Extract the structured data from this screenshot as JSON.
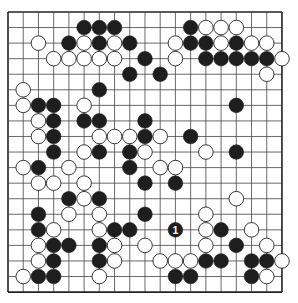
{
  "board": {
    "size": 19,
    "origin_x": 8,
    "origin_y": 12,
    "spacing_x": 15.22,
    "spacing_y": 15.56,
    "stone_radius": 7.3,
    "line_color": "#444444",
    "border_color": "#222222",
    "background": "#ffffff",
    "black_color": "#1e1e1e",
    "white_color": "#ffffff",
    "white_stroke": "#222222"
  },
  "stones": {
    "black": [
      [
        5,
        1
      ],
      [
        6,
        1
      ],
      [
        7,
        1
      ],
      [
        12,
        1
      ],
      [
        4,
        2
      ],
      [
        6,
        2
      ],
      [
        8,
        2
      ],
      [
        12,
        2
      ],
      [
        13,
        2
      ],
      [
        15,
        2
      ],
      [
        9,
        3
      ],
      [
        13,
        3
      ],
      [
        14,
        3
      ],
      [
        15,
        3
      ],
      [
        16,
        3
      ],
      [
        17,
        3
      ],
      [
        8,
        4
      ],
      [
        10,
        4
      ],
      [
        6,
        5
      ],
      [
        2,
        6
      ],
      [
        3,
        6
      ],
      [
        15,
        6
      ],
      [
        3,
        7
      ],
      [
        5,
        7
      ],
      [
        6,
        7
      ],
      [
        9,
        7
      ],
      [
        3,
        8
      ],
      [
        9,
        8
      ],
      [
        12,
        8
      ],
      [
        3,
        9
      ],
      [
        6,
        9
      ],
      [
        8,
        9
      ],
      [
        15,
        9
      ],
      [
        2,
        10
      ],
      [
        8,
        10
      ],
      [
        9,
        11
      ],
      [
        11,
        11
      ],
      [
        4,
        12
      ],
      [
        6,
        12
      ],
      [
        2,
        13
      ],
      [
        9,
        13
      ],
      [
        2,
        14
      ],
      [
        7,
        14
      ],
      [
        8,
        14
      ],
      [
        14,
        14
      ],
      [
        3,
        15
      ],
      [
        4,
        15
      ],
      [
        6,
        15
      ],
      [
        15,
        15
      ],
      [
        3,
        16
      ],
      [
        6,
        16
      ],
      [
        13,
        16
      ],
      [
        14,
        16
      ],
      [
        16,
        16
      ],
      [
        17,
        16
      ],
      [
        2,
        17
      ],
      [
        3,
        17
      ],
      [
        11,
        17
      ],
      [
        12,
        17
      ],
      [
        16,
        17
      ]
    ],
    "white": [
      [
        13,
        1
      ],
      [
        14,
        1
      ],
      [
        15,
        1
      ],
      [
        2,
        2
      ],
      [
        5,
        2
      ],
      [
        7,
        2
      ],
      [
        11,
        2
      ],
      [
        14,
        2
      ],
      [
        16,
        2
      ],
      [
        17,
        2
      ],
      [
        3,
        3
      ],
      [
        4,
        3
      ],
      [
        5,
        3
      ],
      [
        6,
        3
      ],
      [
        7,
        3
      ],
      [
        11,
        3
      ],
      [
        18,
        3
      ],
      [
        17,
        4
      ],
      [
        1,
        5
      ],
      [
        1,
        6
      ],
      [
        5,
        6
      ],
      [
        2,
        7
      ],
      [
        2,
        8
      ],
      [
        6,
        8
      ],
      [
        7,
        8
      ],
      [
        8,
        8
      ],
      [
        10,
        8
      ],
      [
        5,
        9
      ],
      [
        9,
        9
      ],
      [
        13,
        9
      ],
      [
        1,
        10
      ],
      [
        4,
        10
      ],
      [
        10,
        10
      ],
      [
        11,
        10
      ],
      [
        2,
        11
      ],
      [
        3,
        11
      ],
      [
        5,
        11
      ],
      [
        5,
        12
      ],
      [
        15,
        12
      ],
      [
        4,
        13
      ],
      [
        6,
        13
      ],
      [
        13,
        13
      ],
      [
        3,
        14
      ],
      [
        6,
        14
      ],
      [
        13,
        14
      ],
      [
        16,
        14
      ],
      [
        2,
        15
      ],
      [
        7,
        15
      ],
      [
        9,
        15
      ],
      [
        13,
        15
      ],
      [
        17,
        15
      ],
      [
        2,
        16
      ],
      [
        7,
        16
      ],
      [
        10,
        16
      ],
      [
        11,
        16
      ],
      [
        12,
        16
      ],
      [
        18,
        16
      ],
      [
        1,
        17
      ],
      [
        6,
        17
      ],
      [
        17,
        17
      ]
    ],
    "numbered": [
      {
        "col": 11,
        "row": 14,
        "color": "black",
        "label": "1"
      }
    ]
  }
}
